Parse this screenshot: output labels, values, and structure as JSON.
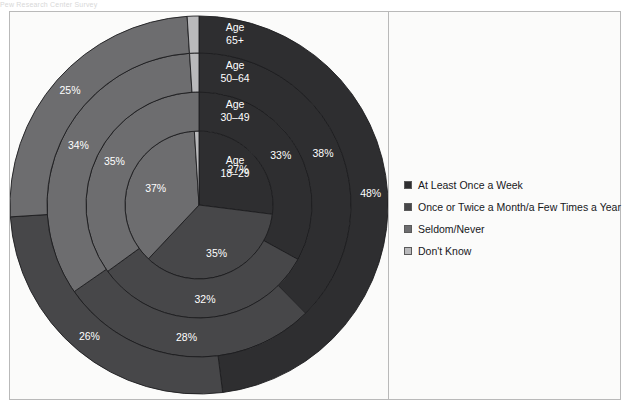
{
  "top_caption": "Pew Research Center Survey",
  "legend": {
    "items": [
      {
        "label": "At Least Once a Week",
        "color": "#2e2e30",
        "name": "legend-at-least-once-a-week"
      },
      {
        "label": "Once or Twice a Month/a Few Times a Year",
        "color": "#474749",
        "name": "legend-once-or-twice"
      },
      {
        "label": "Seldom/Never",
        "color": "#6d6d6f",
        "name": "legend-seldom-never"
      },
      {
        "label": "Don't Know",
        "color": "#b9b9bb",
        "name": "legend-dont-know"
      }
    ]
  },
  "chart_data": {
    "type": "pie",
    "title": "",
    "subtitle": "",
    "xlabel": "",
    "ylabel": "",
    "legend_position": "right",
    "grid": false,
    "note": "Concentric multi-ring pie (sunburst). Each ring is one age group; rings ordered innermost=18-29 to outermost=65+.",
    "categories": [
      "At Least Once a Week",
      "Once or Twice a Month/a Few Times a Year",
      "Seldom/Never",
      "Don't Know"
    ],
    "colors": [
      "#2e2e30",
      "#474749",
      "#6d6d6f",
      "#b9b9bb"
    ],
    "rings": [
      {
        "ring_index": 0,
        "ring_label_line1": "Age",
        "ring_label_line2": "18–29",
        "group": "Age 18-29",
        "values": [
          27,
          35,
          37,
          1
        ],
        "labels": [
          "27%",
          "35%",
          "37%",
          ""
        ]
      },
      {
        "ring_index": 1,
        "ring_label_line1": "Age",
        "ring_label_line2": "30–49",
        "group": "Age 30-49",
        "values": [
          33,
          32,
          35,
          0
        ],
        "labels": [
          "33%",
          "32%",
          "35%",
          ""
        ]
      },
      {
        "ring_index": 2,
        "ring_label_line1": "Age",
        "ring_label_line2": "50–64",
        "group": "Age 50-64",
        "values": [
          38,
          28,
          34,
          1
        ],
        "labels": [
          "38%",
          "28%",
          "34%",
          ""
        ]
      },
      {
        "ring_index": 3,
        "ring_label_line1": "Age",
        "ring_label_line2": "65+",
        "group": "Age 65+",
        "values": [
          48,
          26,
          25,
          1
        ],
        "labels": [
          "48%",
          "26%",
          "25%",
          ""
        ]
      }
    ]
  }
}
